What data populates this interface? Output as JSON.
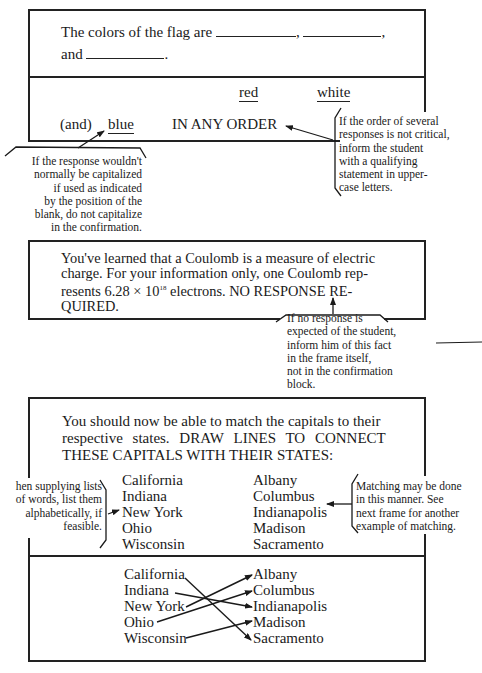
{
  "frame1": {
    "question_line1": "The colors of the flag are",
    "blank_separator_1": ",",
    "blank_separator_2": ",",
    "question_line2_prefix": "and",
    "question_line2_suffix": ".",
    "answers": {
      "red": "red",
      "white": "white",
      "and_prefix": "(and)",
      "blue": "blue",
      "qualifier": "IN ANY ORDER"
    },
    "note_capitalization": [
      "If the response wouldn't",
      "normally be capitalized",
      "if used as indicated",
      "by the position of the",
      "blank, do not capitalize",
      "in the confirmation."
    ],
    "note_order": [
      "If the order of several",
      "responses is not critical,",
      "inform the student",
      "with a qualifying",
      "statement in upper-",
      "case letters."
    ]
  },
  "frame2": {
    "text_lines": [
      "You've learned that a Coulomb is a measure of electric",
      "charge. For your information only, one Coulomb rep-",
      "resents 6.28 × 10",
      "18",
      " electrons. NO RESPONSE RE-",
      "QUIRED."
    ],
    "note_no_response": [
      "If no response is",
      "expected of the student,",
      "inform him of this fact",
      "in the frame itself,",
      "not in the confirmation",
      "block."
    ]
  },
  "frame3": {
    "text_lines": [
      "You should now be able to match the capitals to their",
      "respective states. DRAW LINES TO CONNECT",
      "THESE CAPITALS WITH THEIR STATES:"
    ],
    "states": [
      "California",
      "Indiana",
      "New York",
      "Ohio",
      "Wisconsin"
    ],
    "capitals": [
      "Albany",
      "Columbus",
      "Indianapolis",
      "Madison",
      "Sacramento"
    ],
    "note_alphabetical": [
      "hen supplying lists",
      "of words, list them",
      "alphabetically, if",
      "feasible."
    ],
    "note_matching": [
      "Matching may be done",
      "in this manner. See",
      "next frame for another",
      "example of matching."
    ],
    "answer_states": [
      "California",
      "Indiana",
      "New York",
      "Ohio",
      "Wisconsin"
    ],
    "answer_capitals": [
      "Albany",
      "Columbus",
      "Indianapolis",
      "Madison",
      "Sacramento"
    ],
    "matches": [
      {
        "state": "California",
        "capital": "Sacramento"
      },
      {
        "state": "Indiana",
        "capital": "Indianapolis"
      },
      {
        "state": "New York",
        "capital": "Albany"
      },
      {
        "state": "Ohio",
        "capital": "Columbus"
      },
      {
        "state": "Wisconsin",
        "capital": "Madison"
      }
    ]
  }
}
